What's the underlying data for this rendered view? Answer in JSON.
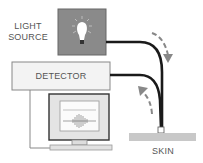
{
  "diagram": {
    "light_source": {
      "label_line1": "LIGHT",
      "label_line2": "SOURCE",
      "fill": "#8a8a8a"
    },
    "detector": {
      "label": "DETECTOR",
      "fill": "#f3f3f3"
    },
    "skin": {
      "label": "SKIN",
      "fill": "#c8c8c8"
    },
    "monitor": {
      "screen_content": "waveform-signal"
    },
    "arrows": [
      {
        "name": "light-out-arrow",
        "direction": "down"
      },
      {
        "name": "light-return-arrow",
        "direction": "up"
      }
    ]
  }
}
